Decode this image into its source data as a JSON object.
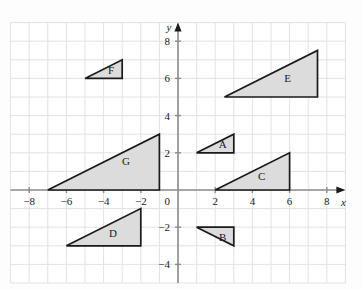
{
  "figure": {
    "type": "coordinate-plane-diagram",
    "background_color": "#fdfdfd",
    "plot_background_color": "#ffffff",
    "grid_color": "#e2e2e6",
    "axis_color": "#8c8c8c",
    "shape_fill_color": "#dcdcdc",
    "shape_stroke_color": "#1a1a1a",
    "label_color": "#1a1a1a"
  },
  "axes": {
    "x_axis_name": "x",
    "y_axis_name": "y",
    "x_range": [
      -9,
      9
    ],
    "y_range": [
      -5,
      9
    ],
    "grid_step": 1,
    "tick_step": 2,
    "origin_label": "0",
    "x_tick_labels": [
      "-8",
      "-6",
      "-4",
      "-2",
      "8",
      "6",
      "4",
      "2"
    ],
    "y_tick_labels": [
      "8",
      "6",
      "4",
      "2",
      "-2",
      "-4"
    ],
    "x_ticks": [
      {
        "value": -8,
        "label": "-8"
      },
      {
        "value": -6,
        "label": "-6"
      },
      {
        "value": -4,
        "label": "-4"
      },
      {
        "value": -2,
        "label": "-2"
      },
      {
        "value": 2,
        "label": "2"
      },
      {
        "value": 4,
        "label": "4"
      },
      {
        "value": 6,
        "label": "6"
      },
      {
        "value": 8,
        "label": "8"
      }
    ],
    "y_ticks": [
      {
        "value": 8,
        "label": "8"
      },
      {
        "value": 6,
        "label": "6"
      },
      {
        "value": 4,
        "label": "4"
      },
      {
        "value": 2,
        "label": "2"
      },
      {
        "value": -2,
        "label": "-2"
      },
      {
        "value": -4,
        "label": "-4"
      }
    ]
  },
  "chart_data": {
    "type": "scatter",
    "title": "",
    "xlabel": "x",
    "ylabel": "y",
    "xlim": [
      -9,
      9
    ],
    "ylim": [
      -5,
      9
    ],
    "grid": true,
    "legend": "none",
    "shapes": [
      {
        "label": "A",
        "kind": "right-triangle",
        "vertices": [
          [
            1,
            2
          ],
          [
            3,
            2
          ],
          [
            3,
            3
          ]
        ],
        "label_position": [
          2.4,
          2.45
        ]
      },
      {
        "label": "B",
        "kind": "right-triangle",
        "vertices": [
          [
            1,
            -2
          ],
          [
            3,
            -2
          ],
          [
            3,
            -3
          ]
        ],
        "label_position": [
          2.4,
          -2.55
        ]
      },
      {
        "label": "C",
        "kind": "right-triangle",
        "vertices": [
          [
            2,
            0
          ],
          [
            6,
            0
          ],
          [
            6,
            2
          ]
        ],
        "label_position": [
          4.5,
          0.75
        ]
      },
      {
        "label": "D",
        "kind": "right-triangle",
        "vertices": [
          [
            -6,
            -3
          ],
          [
            -2,
            -3
          ],
          [
            -2,
            -1
          ]
        ],
        "label_position": [
          -3.5,
          -2.3
        ]
      },
      {
        "label": "E",
        "kind": "right-triangle",
        "vertices": [
          [
            2.5,
            5
          ],
          [
            7.5,
            5
          ],
          [
            7.5,
            7.5
          ]
        ],
        "label_position": [
          5.9,
          6.0
        ]
      },
      {
        "label": "F",
        "kind": "right-triangle",
        "vertices": [
          [
            -5,
            6
          ],
          [
            -3,
            6
          ],
          [
            -3,
            7
          ]
        ],
        "label_position": [
          -3.6,
          6.45
        ]
      },
      {
        "label": "G",
        "kind": "right-triangle",
        "vertices": [
          [
            -7,
            0
          ],
          [
            -1,
            0
          ],
          [
            -1,
            3
          ]
        ],
        "label_position": [
          -2.8,
          1.55
        ]
      }
    ]
  }
}
